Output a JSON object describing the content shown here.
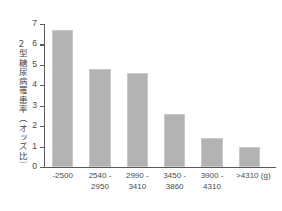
{
  "chart_data": {
    "type": "bar",
    "title": "",
    "xlabel": "",
    "ylabel": "2型糖尿病罹患率（オッズ比）",
    "x_unit": "(g)",
    "categories": [
      "-2500",
      "2540 -\n2950",
      "2990 -\n3410",
      "3450 -\n3860",
      "3900 -\n4310",
      ">4310"
    ],
    "values": [
      6.7,
      4.8,
      4.6,
      2.6,
      1.4,
      1.0
    ],
    "ylim": [
      0,
      7
    ],
    "y_ticks": [
      "0",
      "1",
      "2",
      "3",
      "4",
      "5",
      "6",
      "7"
    ],
    "grid": false,
    "legend": null,
    "bar_color": "#b3b3b3",
    "axis_color": "#5b5b5b",
    "background": "#ffffff"
  },
  "axis": {
    "y_title": "2型糖尿病罹患率（オッズ比）"
  }
}
